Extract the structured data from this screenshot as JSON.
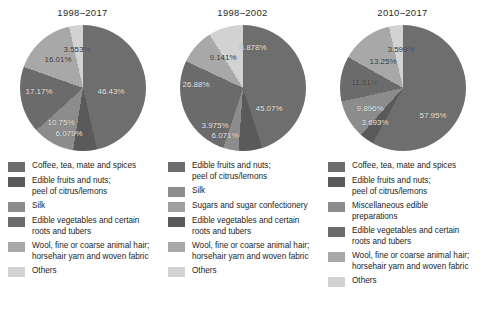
{
  "chart_data": [
    {
      "type": "pie",
      "title": "1998–2017",
      "categories": [
        "Coffee, tea, mate and spices",
        "Edible fruits and nuts;\npeel of citrus/lemons",
        "Silk",
        "Edible vegetables and certain\nroots and tubers",
        "Wool, fine or coarse animal hair;\nhorsehair yarn and woven fabric",
        "Others"
      ],
      "values": [
        46.43,
        6.079,
        10.75,
        17.17,
        16.01,
        3.553
      ],
      "labels": [
        "46.43%",
        "6.079%",
        "10.75%",
        "17.17%",
        "16.01%",
        "3.553%"
      ],
      "colors": [
        "#6e6e6e",
        "#5a5a5a",
        "#8c8c8c",
        "#6b6b6b",
        "#a8a8a8",
        "#d2d2d2"
      ],
      "legend_position": "below"
    },
    {
      "type": "pie",
      "title": "1998–2002",
      "categories": [
        "Edible fruits and nuts;\npeel of citrus/lemons",
        "Silk",
        "Sugars and sugar confectionery",
        "Edible vegetables and certain\nroots and tubers",
        "Wool, fine or coarse animal hair;\nhorsehair yarn and woven fabric",
        "Others"
      ],
      "values": [
        45.07,
        6.071,
        3.975,
        26.88,
        9.141,
        8.878
      ],
      "labels": [
        "45.07%",
        "6.071%",
        "3.975%",
        "26.88%",
        "9.141%",
        "8.878%"
      ],
      "colors": [
        "#6e6e6e",
        "#5a5a5a",
        "#8c8c8c",
        "#6b6b6b",
        "#a8a8a8",
        "#d2d2d2"
      ],
      "legend_position": "below"
    },
    {
      "type": "pie",
      "title": "2010–2017",
      "categories": [
        "Coffee, tea, mate and spices",
        "Edible fruits and nuts;\npeel of citrus/lemons",
        "Miscellaneous edible\npreparations",
        "Edible vegetables and certain\nroots and tubers",
        "Wool, fine or coarse animal hair;\nhorsehair yarn and woven fabric",
        "Others"
      ],
      "values": [
        57.95,
        3.693,
        9.896,
        11.61,
        13.25,
        3.599
      ],
      "labels": [
        "57.95%",
        "3.693%",
        "9.896%",
        "11.61%",
        "13.25%",
        "3.599%"
      ],
      "colors": [
        "#6e6e6e",
        "#5a5a5a",
        "#8c8c8c",
        "#6b6b6b",
        "#a8a8a8",
        "#d2d2d2"
      ],
      "legend_position": "below"
    }
  ],
  "panels": [
    {
      "title": "1998–2017",
      "slice_labels": [
        {
          "text": "46.43%",
          "x": 78,
          "y": 62,
          "dark": false
        },
        {
          "text": "6.079%",
          "x": 36,
          "y": 104,
          "dark": false
        },
        {
          "text": "10.75%",
          "x": 28,
          "y": 93,
          "dark": false
        },
        {
          "text": "17.17%",
          "x": 6,
          "y": 62,
          "dark": false
        },
        {
          "text": "16.01%",
          "x": 25,
          "y": 30,
          "dark": true
        },
        {
          "text": "3.553%",
          "x": 44,
          "y": 20,
          "dark": true
        }
      ],
      "legend": [
        {
          "color": "#6e6e6e",
          "text": "Coffee, tea, mate and spices"
        },
        {
          "color": "#5a5a5a",
          "text": "Edible fruits and nuts;\n peel of citrus/lemons"
        },
        {
          "color": "#8c8c8c",
          "text": "Silk"
        },
        {
          "color": "#6b6b6b",
          "text": "Edible vegetables and certain\nroots and tubers"
        },
        {
          "color": "#a8a8a8",
          "text": "Wool, fine or coarse animal hair;\nhorsehair yarn and woven fabric"
        },
        {
          "color": "#d2d2d2",
          "text": "Others"
        }
      ]
    },
    {
      "title": "1998–2002",
      "slice_labels": [
        {
          "text": "45.07%",
          "x": 76,
          "y": 79,
          "dark": false
        },
        {
          "text": "6.071%",
          "x": 32,
          "y": 106,
          "dark": false
        },
        {
          "text": "3.975%",
          "x": 22,
          "y": 96,
          "dark": false
        },
        {
          "text": "26.88%",
          "x": 3,
          "y": 55,
          "dark": false
        },
        {
          "text": "9.141%",
          "x": 30,
          "y": 28,
          "dark": true
        },
        {
          "text": "8.878%",
          "x": 60,
          "y": 18,
          "dark": false
        }
      ],
      "legend": [
        {
          "color": "#6e6e6e",
          "text": "Edible fruits and nuts;\n peel of citrus/lemons"
        },
        {
          "color": "#8c8c8c",
          "text": "Silk"
        },
        {
          "color": "#a0a0a0",
          "text": "Sugars and sugar confectionery"
        },
        {
          "color": "#5a5a5a",
          "text": "Edible vegetables and certain\nroots and tubers"
        },
        {
          "color": "#a8a8a8",
          "text": "Wool, fine or coarse animal hair;\nhorsehair yarn and woven fabric"
        },
        {
          "color": "#d2d2d2",
          "text": "Others"
        }
      ]
    },
    {
      "title": "2010–2017",
      "slice_labels": [
        {
          "text": "57.95%",
          "x": 80,
          "y": 86,
          "dark": false
        },
        {
          "text": "3.693%",
          "x": 22,
          "y": 93,
          "dark": false
        },
        {
          "text": "9.896%",
          "x": 17,
          "y": 79,
          "dark": false
        },
        {
          "text": "11.61%",
          "x": 12,
          "y": 53,
          "dark": true
        },
        {
          "text": "13.25%",
          "x": 30,
          "y": 32,
          "dark": true
        },
        {
          "text": "3.599%",
          "x": 48,
          "y": 20,
          "dark": true
        }
      ],
      "legend": [
        {
          "color": "#6e6e6e",
          "text": "Coffee, tea, mate and spices"
        },
        {
          "color": "#5a5a5a",
          "text": "Edible fruits and nuts;\n peel of citrus/lemons"
        },
        {
          "color": "#8c8c8c",
          "text": "Miscellaneous edible\npreparations"
        },
        {
          "color": "#6b6b6b",
          "text": "Edible vegetables and certain\nroots and tubers"
        },
        {
          "color": "#a8a8a8",
          "text": "Wool, fine or coarse animal hair;\nhorsehair yarn and woven fabric"
        },
        {
          "color": "#d2d2d2",
          "text": "Others"
        }
      ]
    }
  ]
}
